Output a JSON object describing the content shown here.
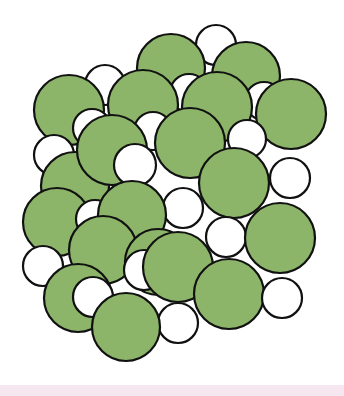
{
  "figure": {
    "colors": {
      "large_fill": "#8cb56a",
      "small_fill": "#ffffff",
      "stroke": "#111111",
      "background": "#ffffff",
      "band": "#f6e6ef"
    },
    "stroke_width": 2.2,
    "circles": [
      {
        "kind": "small",
        "cx": 216,
        "cy": 45,
        "r": 20
      },
      {
        "kind": "small",
        "cx": 105,
        "cy": 85,
        "r": 20
      },
      {
        "kind": "large",
        "cx": 171,
        "cy": 68,
        "r": 34
      },
      {
        "kind": "large",
        "cx": 246,
        "cy": 76,
        "r": 34
      },
      {
        "kind": "small",
        "cx": 189,
        "cy": 93,
        "r": 19
      },
      {
        "kind": "small",
        "cx": 264,
        "cy": 101,
        "r": 19
      },
      {
        "kind": "large",
        "cx": 69,
        "cy": 110,
        "r": 35
      },
      {
        "kind": "large",
        "cx": 143,
        "cy": 105,
        "r": 35
      },
      {
        "kind": "large",
        "cx": 217,
        "cy": 107,
        "r": 35
      },
      {
        "kind": "large",
        "cx": 291,
        "cy": 114,
        "r": 35
      },
      {
        "kind": "small",
        "cx": 54,
        "cy": 155,
        "r": 20
      },
      {
        "kind": "small",
        "cx": 92,
        "cy": 128,
        "r": 19
      },
      {
        "kind": "small",
        "cx": 153,
        "cy": 131,
        "r": 19
      },
      {
        "kind": "small",
        "cx": 247,
        "cy": 139,
        "r": 19
      },
      {
        "kind": "large",
        "cx": 75,
        "cy": 186,
        "r": 34
      },
      {
        "kind": "large",
        "cx": 112,
        "cy": 150,
        "r": 35
      },
      {
        "kind": "large",
        "cx": 190,
        "cy": 143,
        "r": 35
      },
      {
        "kind": "small",
        "cx": 135,
        "cy": 165,
        "r": 21
      },
      {
        "kind": "small",
        "cx": 290,
        "cy": 178,
        "r": 20
      },
      {
        "kind": "large",
        "cx": 57,
        "cy": 222,
        "r": 34
      },
      {
        "kind": "small",
        "cx": 95,
        "cy": 219,
        "r": 19
      },
      {
        "kind": "large",
        "cx": 234,
        "cy": 183,
        "r": 35
      },
      {
        "kind": "small",
        "cx": 183,
        "cy": 208,
        "r": 20
      },
      {
        "kind": "large",
        "cx": 132,
        "cy": 215,
        "r": 34
      },
      {
        "kind": "small",
        "cx": 43,
        "cy": 266,
        "r": 20
      },
      {
        "kind": "large",
        "cx": 103,
        "cy": 250,
        "r": 34
      },
      {
        "kind": "large",
        "cx": 158,
        "cy": 262,
        "r": 33
      },
      {
        "kind": "small",
        "cx": 226,
        "cy": 237,
        "r": 20
      },
      {
        "kind": "large",
        "cx": 280,
        "cy": 238,
        "r": 35
      },
      {
        "kind": "small",
        "cx": 144,
        "cy": 270,
        "r": 20
      },
      {
        "kind": "large",
        "cx": 78,
        "cy": 298,
        "r": 34
      },
      {
        "kind": "large",
        "cx": 178,
        "cy": 267,
        "r": 35
      },
      {
        "kind": "large",
        "cx": 229,
        "cy": 294,
        "r": 35
      },
      {
        "kind": "small",
        "cx": 282,
        "cy": 298,
        "r": 20
      },
      {
        "kind": "small",
        "cx": 93,
        "cy": 297,
        "r": 20
      },
      {
        "kind": "small",
        "cx": 178,
        "cy": 323,
        "r": 20
      },
      {
        "kind": "large",
        "cx": 126,
        "cy": 327,
        "r": 34
      }
    ]
  }
}
